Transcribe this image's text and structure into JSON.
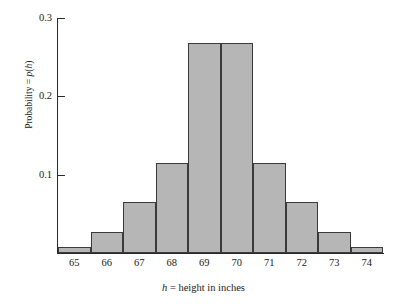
{
  "chart_data": {
    "type": "bar",
    "title": "",
    "subtitle": "",
    "xlabel": "h = height in inches",
    "xlabel_italic_part": "h",
    "xlabel_rest": " = height in inches",
    "ylabel": "Probability = p(h)",
    "ylabel_prefix": "Probability = ",
    "ylabel_italic_p": "p",
    "ylabel_paren_open": "(",
    "ylabel_italic_h": "h",
    "ylabel_paren_close": ")",
    "categories": [
      "65",
      "66",
      "67",
      "68",
      "69",
      "70",
      "71",
      "72",
      "73",
      "74"
    ],
    "values": [
      0.008,
      0.027,
      0.065,
      0.115,
      0.268,
      0.268,
      0.115,
      0.065,
      0.027,
      0.008
    ],
    "xtick_labels": [
      "65",
      "66",
      "67",
      "68",
      "69",
      "70",
      "71",
      "72",
      "73",
      "74"
    ],
    "ytick_labels": [
      "0.3",
      "0.2",
      "0.1"
    ],
    "ytick_values": [
      0.3,
      0.2,
      0.1
    ],
    "ylim": [
      0,
      0.3
    ],
    "grid": false,
    "legend": null,
    "bar_fill_color": "#b6b6b6",
    "bar_edge_color": "#3a3a3a",
    "axis_color": "#2a2a2a",
    "background_color": "#ffffff"
  }
}
